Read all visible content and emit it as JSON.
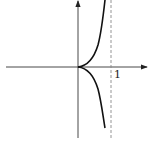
{
  "diagram": {
    "type": "function-graph",
    "x_axis": {
      "direction": "right",
      "arrow": true
    },
    "y_axis": {
      "direction": "up",
      "arrow": true
    },
    "asymptote": {
      "x": 1,
      "style": "dashed",
      "label": "1"
    },
    "curve": {
      "cusp_at": [
        0,
        0
      ],
      "branches": [
        "upper",
        "lower"
      ]
    },
    "colors": {
      "curve": "#111111",
      "axes": "#333333",
      "asymptote": "#888888"
    }
  }
}
